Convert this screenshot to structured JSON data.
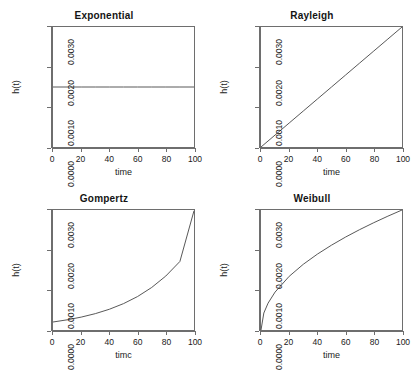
{
  "figure": {
    "background": "#ffffff",
    "curve_color": "#555555",
    "axis_color": "#6e6e6e",
    "rows": 2,
    "cols": 2
  },
  "chart_data": [
    {
      "type": "line",
      "title": "Exponential",
      "xlabel": "time",
      "ylabel": "h(t)",
      "xlim": [
        0,
        100
      ],
      "ylim": [
        0,
        0.003
      ],
      "xticks": [
        0,
        20,
        40,
        60,
        80,
        100
      ],
      "xtick_labels": [
        "0",
        "20",
        "40",
        "60",
        "80",
        "100"
      ],
      "yticks": [
        0.0,
        0.001,
        0.002,
        0.003
      ],
      "ytick_labels": [
        "0.0000",
        "0.0010",
        "0.0020",
        "0.0030"
      ],
      "grid": false,
      "legend": "none",
      "x": [
        0,
        10,
        20,
        30,
        40,
        50,
        60,
        70,
        80,
        90,
        100
      ],
      "values": [
        0.0015,
        0.0015,
        0.0015,
        0.0015,
        0.0015,
        0.0015,
        0.0015,
        0.0015,
        0.0015,
        0.0015,
        0.0015
      ]
    },
    {
      "type": "line",
      "title": "Rayleigh",
      "xlabel": "time",
      "ylabel": "h(t)",
      "xlim": [
        0,
        100
      ],
      "ylim": [
        0,
        0.003
      ],
      "xticks": [
        0,
        20,
        40,
        60,
        80,
        100
      ],
      "xtick_labels": [
        "0",
        "20",
        "40",
        "60",
        "80",
        "100"
      ],
      "yticks": [
        0.0,
        0.001,
        0.002,
        0.003
      ],
      "ytick_labels": [
        "0.0000",
        "0.0010",
        "0.0020",
        "0.0030"
      ],
      "grid": false,
      "legend": "none",
      "x": [
        0,
        10,
        20,
        30,
        40,
        50,
        60,
        70,
        80,
        90,
        100
      ],
      "values": [
        0.0,
        0.0003,
        0.0006,
        0.0009,
        0.0012,
        0.0015,
        0.0018,
        0.0021,
        0.0024,
        0.0027,
        0.003
      ]
    },
    {
      "type": "line",
      "title": "Gompertz",
      "xlabel": "timc",
      "ylabel": "h(t)",
      "xlim": [
        0,
        100
      ],
      "ylim": [
        0,
        0.003
      ],
      "xticks": [
        0,
        20,
        40,
        60,
        80,
        100
      ],
      "xtick_labels": [
        "0",
        "20",
        "40",
        "60",
        "80",
        "100"
      ],
      "yticks": [
        0.0,
        0.001,
        0.002,
        0.003
      ],
      "ytick_labels": [
        "0.0000",
        "0.0010",
        "0.0020",
        "0.0030"
      ],
      "grid": false,
      "legend": "none",
      "x": [
        0,
        10,
        20,
        30,
        40,
        50,
        60,
        70,
        80,
        90,
        100
      ],
      "values": [
        0.0002,
        0.000254,
        0.000322,
        0.000409,
        0.000519,
        0.000659,
        0.000837,
        0.001063,
        0.001349,
        0.001713,
        0.00298
      ]
    },
    {
      "type": "line",
      "title": "Weibull",
      "xlabel": "time",
      "ylabel": "h(t)",
      "xlim": [
        0,
        100
      ],
      "ylim": [
        0,
        0.003
      ],
      "xticks": [
        0,
        20,
        40,
        60,
        80,
        100
      ],
      "xtick_labels": [
        "0",
        "20",
        "40",
        "60",
        "80",
        "100"
      ],
      "yticks": [
        0.0,
        0.001,
        0.002,
        0.003
      ],
      "ytick_labels": [
        "0.0000",
        "0.0010",
        "0.0020",
        "0.0030"
      ],
      "grid": false,
      "legend": "none",
      "x": [
        0,
        2,
        5,
        10,
        20,
        30,
        40,
        50,
        60,
        70,
        80,
        90,
        100
      ],
      "values": [
        0.0,
        0.000424,
        0.000671,
        0.000949,
        0.001342,
        0.001643,
        0.001897,
        0.002121,
        0.002324,
        0.00251,
        0.002683,
        0.002846,
        0.003
      ]
    }
  ]
}
